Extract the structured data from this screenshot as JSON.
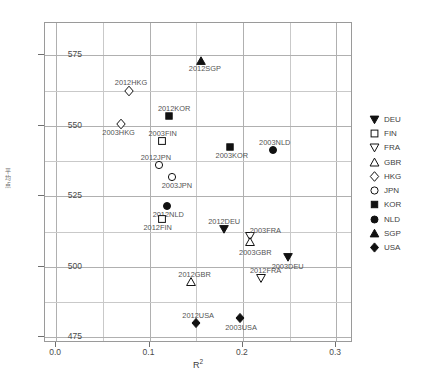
{
  "chart_data": {
    "type": "scatter",
    "title": "",
    "xlabel": "R²",
    "ylabel": "平均点",
    "xlim": [
      -0.012,
      0.318
    ],
    "ylim": [
      473.0,
      586.5
    ],
    "xticks": [
      "0.0",
      "0.1",
      "0.2",
      "0.3"
    ],
    "xtick_values": [
      0.0,
      0.1,
      0.2,
      0.3
    ],
    "yticks": [
      "475",
      "500",
      "525",
      "550",
      "575"
    ],
    "ytick_values": [
      475,
      500,
      525,
      550,
      575
    ],
    "grid": true,
    "x_gridline_values": [
      0.0,
      0.05,
      0.1,
      0.15,
      0.2,
      0.25,
      0.3
    ],
    "y_gridline_values": [
      475,
      487.5,
      500,
      512.5,
      525,
      537.5,
      550,
      562.5,
      575
    ],
    "legend_position": "right",
    "legend": [
      {
        "label": "DEU",
        "marker": "triangle-down-filled"
      },
      {
        "label": "FIN",
        "marker": "square-open"
      },
      {
        "label": "FRA",
        "marker": "triangle-down-open"
      },
      {
        "label": "GBR",
        "marker": "triangle-up-open"
      },
      {
        "label": "HKG",
        "marker": "diamond-open"
      },
      {
        "label": "JPN",
        "marker": "circle-open"
      },
      {
        "label": "KOR",
        "marker": "square-filled"
      },
      {
        "label": "NLD",
        "marker": "circle-filled"
      },
      {
        "label": "SGP",
        "marker": "triangle-up-filled"
      },
      {
        "label": "USA",
        "marker": "diamond-filled"
      }
    ],
    "points": [
      {
        "label": "2012SGP",
        "country": "SGP",
        "marker": "triangle-up-filled",
        "x": 0.155,
        "y": 573.0,
        "label_dx": 4,
        "label_dy": 8
      },
      {
        "label": "2012HKG",
        "country": "HKG",
        "marker": "diamond-open",
        "x": 0.078,
        "y": 562.5,
        "label_dx": 2,
        "label_dy": -8
      },
      {
        "label": "2012KOR",
        "country": "KOR",
        "marker": "square-filled",
        "x": 0.121,
        "y": 553.5,
        "label_dx": 5,
        "label_dy": -7
      },
      {
        "label": "2003HKG",
        "country": "HKG",
        "marker": "diamond-open",
        "x": 0.069,
        "y": 550.5,
        "label_dx": -2,
        "label_dy": 9
      },
      {
        "label": "2003FIN",
        "country": "FIN",
        "marker": "square-open",
        "x": 0.113,
        "y": 544.5,
        "label_dx": 1,
        "label_dy": -7
      },
      {
        "label": "2003KOR",
        "country": "KOR",
        "marker": "square-filled",
        "x": 0.186,
        "y": 542.5,
        "label_dx": 2,
        "label_dy": 9
      },
      {
        "label": "2003NLD",
        "country": "NLD",
        "marker": "circle-filled",
        "x": 0.232,
        "y": 541.5,
        "label_dx": 2,
        "label_dy": -7
      },
      {
        "label": "2012JPN",
        "country": "JPN",
        "marker": "circle-open",
        "x": 0.11,
        "y": 536.0,
        "label_dx": -3,
        "label_dy": -7
      },
      {
        "label": "2003JPN",
        "country": "JPN",
        "marker": "circle-open",
        "x": 0.124,
        "y": 532.0,
        "label_dx": 5,
        "label_dy": 9
      },
      {
        "label": "2012NLD",
        "country": "NLD",
        "marker": "circle-filled",
        "x": 0.119,
        "y": 521.5,
        "label_dx": 1,
        "label_dy": 9
      },
      {
        "label": "2012FIN",
        "country": "FIN",
        "marker": "square-open",
        "x": 0.113,
        "y": 517.0,
        "label_dx": -4,
        "label_dy": 9
      },
      {
        "label": "2012DEU",
        "country": "DEU",
        "marker": "triangle-down-filled",
        "x": 0.18,
        "y": 513.5,
        "label_dx": 0,
        "label_dy": -7
      },
      {
        "label": "2003FRA",
        "country": "FRA",
        "marker": "triangle-down-open",
        "x": 0.208,
        "y": 511.0,
        "label_dx": 15,
        "label_dy": -5
      },
      {
        "label": "2003GBR",
        "country": "GBR",
        "marker": "triangle-up-open",
        "x": 0.208,
        "y": 509.0,
        "label_dx": 5,
        "label_dy": 11
      },
      {
        "label": "2003DEU",
        "country": "DEU",
        "marker": "triangle-down-filled",
        "x": 0.248,
        "y": 503.5,
        "label_dx": 0,
        "label_dy": 10
      },
      {
        "label": "2012FRA",
        "country": "FRA",
        "marker": "triangle-down-open",
        "x": 0.219,
        "y": 496.0,
        "label_dx": 5,
        "label_dy": -7
      },
      {
        "label": "2012GBR",
        "country": "GBR",
        "marker": "triangle-up-open",
        "x": 0.144,
        "y": 494.5,
        "label_dx": 4,
        "label_dy": -7
      },
      {
        "label": "2003USA",
        "country": "USA",
        "marker": "diamond-filled",
        "x": 0.197,
        "y": 482.0,
        "label_dx": 1,
        "label_dy": 10
      },
      {
        "label": "2012USA",
        "country": "USA",
        "marker": "diamond-filled",
        "x": 0.15,
        "y": 480.0,
        "label_dx": 2,
        "label_dy": -7
      }
    ]
  },
  "colors": {
    "marker": "#111111",
    "grid": "#c9c9c9",
    "frame": "#9a9a9a",
    "text": "#4a4a4a",
    "background": "#ffffff"
  }
}
